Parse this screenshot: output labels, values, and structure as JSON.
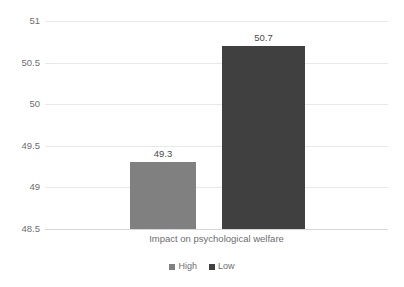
{
  "chart_data": {
    "type": "bar",
    "title": "",
    "subtitle": "",
    "xlabel": "Impact on psychological welfare",
    "ylabel": "",
    "categories": [
      "Impact on psychological welfare"
    ],
    "series": [
      {
        "name": "High",
        "values": [
          49.3
        ],
        "color": "#808080"
      },
      {
        "name": "Low",
        "values": [
          50.7
        ],
        "color": "#404040"
      }
    ],
    "data_labels": [
      "49.3",
      "50.7"
    ],
    "ylim": [
      48.5,
      51
    ],
    "ytick_step": 0.5,
    "ytick_labels": [
      "51",
      "50.5",
      "50",
      "49.5",
      "49",
      "48.5"
    ],
    "ytick_values": [
      51,
      50.5,
      50,
      49.5,
      49,
      48.5
    ],
    "grid": true,
    "grid_axis": "y",
    "legend_position": "bottom"
  },
  "axis": {
    "ticks": [
      {
        "label": "51",
        "value": 51
      },
      {
        "label": "50.5",
        "value": 50.5
      },
      {
        "label": "50",
        "value": 50
      },
      {
        "label": "49.5",
        "value": 49.5
      },
      {
        "label": "49",
        "value": 49
      },
      {
        "label": "48.5",
        "value": 48.5
      }
    ]
  },
  "bars": [
    {
      "name": "High",
      "label": "49.3",
      "value": 49.3,
      "color": "#808080"
    },
    {
      "name": "Low",
      "label": "50.7",
      "value": 50.7,
      "color": "#404040"
    }
  ],
  "category": {
    "label": "Impact on psychological welfare"
  },
  "legend": {
    "items": [
      {
        "label": "High",
        "color": "#808080"
      },
      {
        "label": "Low",
        "color": "#404040"
      }
    ]
  },
  "colors": {
    "gridline": "#e8e8e8",
    "axis": "#d6d6d6",
    "tick_text": "#6e6e6e",
    "label_text": "#4a4a4a",
    "background": "#ffffff"
  }
}
